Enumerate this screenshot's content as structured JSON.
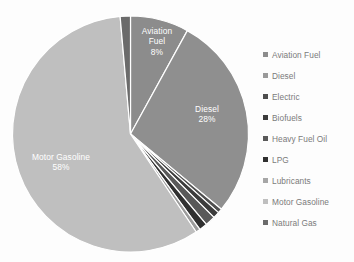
{
  "chart_data": {
    "type": "pie",
    "title": "",
    "categories": [
      "Aviation Fuel",
      "Diesel",
      "Electric",
      "Biofuels",
      "Heavy Fuel Oil",
      "LPG",
      "Lubricants",
      "Motor Gasoline",
      "Natural Gas"
    ],
    "values": [
      8,
      28,
      0.6,
      0.9,
      1.4,
      1.1,
      0.6,
      58,
      1.4
    ],
    "unit": "%",
    "start_angle_deg": 0,
    "direction": "clockwise",
    "legend_position": "right",
    "grid": false,
    "colors": [
      "#8c8c8c",
      "#8f8f8f",
      "#4e4e4e",
      "#3c3c3c",
      "#595959",
      "#303030",
      "#9c9c9c",
      "#bfbfbf",
      "#6b6b6b"
    ],
    "data_labels": [
      {
        "name": "Aviation Fuel",
        "label": "Aviation Fuel",
        "pct": "8%"
      },
      {
        "name": "Diesel",
        "label": "Diesel",
        "pct": "28%"
      },
      {
        "name": "Motor Gasoline",
        "label": "Motor Gasoline",
        "pct": "58%"
      }
    ]
  },
  "slice_labels": {
    "aviation": {
      "line1": "Aviation",
      "line2": "Fuel",
      "pct": "8%"
    },
    "diesel": {
      "line1": "Diesel",
      "pct": "28%"
    },
    "gasoline": {
      "line1": "Motor Gasoline",
      "pct": "58%"
    }
  },
  "legend": {
    "items": [
      {
        "label": "Aviation Fuel",
        "color": "#8c8c8c"
      },
      {
        "label": "Diesel",
        "color": "#9a9a9a"
      },
      {
        "label": "Electric",
        "color": "#4e4e4e"
      },
      {
        "label": "Biofuels",
        "color": "#3c3c3c"
      },
      {
        "label": "Heavy Fuel Oil",
        "color": "#595959"
      },
      {
        "label": "LPG",
        "color": "#303030"
      },
      {
        "label": "Lubricants",
        "color": "#a6a6a6"
      },
      {
        "label": "Motor Gasoline",
        "color": "#bfbfbf"
      },
      {
        "label": "Natural Gas",
        "color": "#6b6b6b"
      }
    ]
  }
}
